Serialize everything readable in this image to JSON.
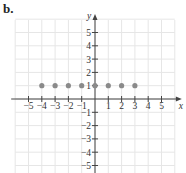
{
  "panel_label": "b.",
  "chart_data": {
    "type": "scatter",
    "title": "",
    "xlabel": "x",
    "ylabel": "y",
    "xlim": [
      -6,
      6
    ],
    "ylim": [
      -5.5,
      6
    ],
    "grid": true,
    "x_ticks": [
      -5,
      -4,
      -3,
      -2,
      -1,
      1,
      2,
      3,
      4,
      5
    ],
    "y_ticks": [
      5,
      4,
      3,
      2,
      1,
      -1,
      -2,
      -3,
      -4,
      -5
    ],
    "series": [
      {
        "name": "points",
        "color": "#8a8a8a",
        "points": [
          [
            -4,
            1
          ],
          [
            -3,
            1
          ],
          [
            -2,
            1
          ],
          [
            -1,
            1
          ],
          [
            0,
            1
          ],
          [
            1,
            1
          ],
          [
            2,
            1
          ],
          [
            3,
            1
          ]
        ]
      }
    ]
  }
}
